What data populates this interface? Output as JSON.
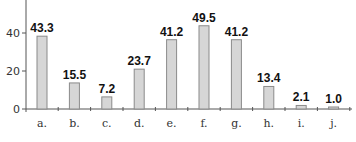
{
  "chart_data": {
    "type": "bar",
    "title": "",
    "xlabel": "",
    "ylabel": "",
    "categories": [
      "a.",
      "b.",
      "c.",
      "d.",
      "e.",
      "f.",
      "g.",
      "h.",
      "i.",
      "j."
    ],
    "values": [
      43.3,
      15.5,
      7.2,
      23.7,
      41.2,
      49.5,
      41.2,
      13.4,
      2.1,
      1.0
    ],
    "data_labels": [
      "43.3",
      "15.5",
      "7.2",
      "23.7",
      "41.2",
      "49.5",
      "41.2",
      "13.4",
      "2.1",
      "1.0"
    ],
    "yticks": [
      0,
      20,
      40
    ],
    "ylim": [
      0,
      57
    ],
    "grid": false,
    "legend": null
  },
  "colors": {
    "bar_fill": "#d6d6d6",
    "bar_stroke": "#8a8a8a",
    "axis": "#555555",
    "text": "#333333"
  }
}
